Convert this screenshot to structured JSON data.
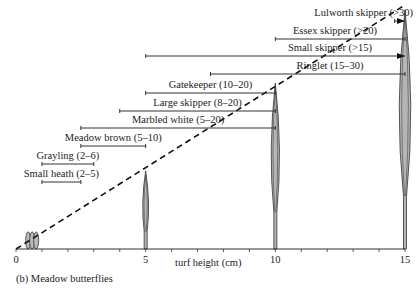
{
  "chart_data": {
    "type": "diagram",
    "title": "(b) Meadow butterflies",
    "xlabel": "turf height (cm)",
    "xlim": [
      0,
      15
    ],
    "x_ticks": [
      0,
      5,
      10,
      15
    ],
    "minor_tick_step": 1,
    "dashed_trend": {
      "from": [
        0,
        0
      ],
      "to": [
        15,
        1
      ]
    },
    "species": [
      {
        "label": "Small heath (2–5)",
        "from": 1,
        "to": 2.5,
        "arrow": false
      },
      {
        "label": "Grayling (2–6)",
        "from": 1,
        "to": 3,
        "arrow": false
      },
      {
        "label": "Meadow brown (5–10)",
        "from": 2.5,
        "to": 5,
        "arrow": false
      },
      {
        "label": "Marbled white (5–20)",
        "from": 2.5,
        "to": 10,
        "arrow": false
      },
      {
        "label": "Large skipper (8–20)",
        "from": 4,
        "to": 10,
        "arrow": false
      },
      {
        "label": "Gatekeeper (10–20)",
        "from": 5,
        "to": 10,
        "arrow": false
      },
      {
        "label": "Ringlet (15–30)",
        "from": 7.5,
        "to": 15,
        "arrow": false
      },
      {
        "label": "Small skipper (>15)",
        "from": 5,
        "to": 15,
        "arrow": true
      },
      {
        "label": "Essex skipper (>20)",
        "from": 10,
        "to": 15,
        "arrow": false
      },
      {
        "label": "Lulworth skipper (>30)",
        "from": 14.6,
        "to": 15,
        "arrow": true
      }
    ],
    "grass_clumps": [
      {
        "x": 0.7,
        "height": 0.07
      },
      {
        "x": 5,
        "height": 0.32
      },
      {
        "x": 10,
        "height": 0.68
      },
      {
        "x": 15,
        "height": 0.98
      }
    ]
  }
}
